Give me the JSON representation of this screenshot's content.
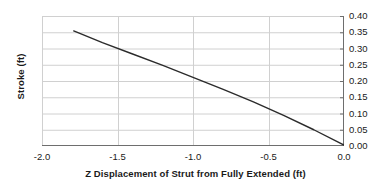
{
  "chart_data": {
    "type": "line",
    "title": "",
    "xlabel": "Z Displacement of Strut from Fully Extended (ft)",
    "ylabel": "Stroke (ft)",
    "xlim": [
      -2.0,
      0.0
    ],
    "ylim": [
      0.0,
      0.4
    ],
    "xticks": [
      -2.0,
      -1.5,
      -1.0,
      -0.5,
      0.0
    ],
    "xtick_labels": [
      "-2.0",
      "-1.5",
      "-1.0",
      "-0.5",
      "0.0"
    ],
    "yticks": [
      0.0,
      0.05,
      0.1,
      0.15,
      0.2,
      0.25,
      0.3,
      0.35,
      0.4
    ],
    "ytick_labels": [
      "0.00",
      "0.05",
      "0.10",
      "0.15",
      "0.20",
      "0.25",
      "0.30",
      "0.35",
      "0.40"
    ],
    "y_axis_position": "right",
    "grid": true,
    "grid_axes": "both",
    "legend": "none",
    "series": [
      {
        "name": "Stroke",
        "color": "#2b2b2b",
        "line_width": 1.4,
        "x": [
          -1.79,
          -1.6,
          -1.4,
          -1.2,
          -1.0,
          -0.8,
          -0.6,
          -0.4,
          -0.2,
          0.0
        ],
        "y": [
          0.354,
          0.318,
          0.283,
          0.248,
          0.211,
          0.174,
          0.136,
          0.094,
          0.05,
          0.003
        ]
      }
    ]
  },
  "style": {
    "background": "#ffffff",
    "grid_color": "#d0d0d0",
    "axis_color": "#6e6e6e",
    "text_color": "#1a1a1a",
    "line_color": "#2b2b2b"
  }
}
